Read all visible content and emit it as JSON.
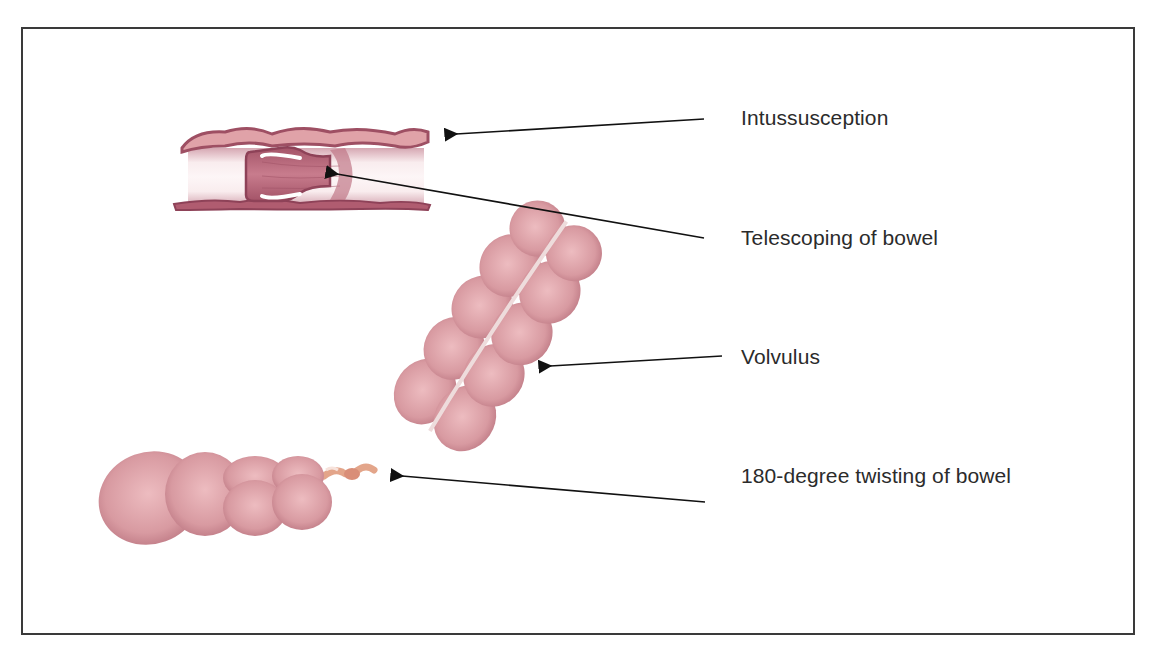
{
  "diagram": {
    "labels": [
      {
        "id": "intussusception",
        "text": "Intussusception",
        "x": 741,
        "y": 103
      },
      {
        "id": "telescoping",
        "text": "Telescoping of bowel",
        "x": 741,
        "y": 223
      },
      {
        "id": "volvulus",
        "text": "Volvulus",
        "x": 741,
        "y": 342
      },
      {
        "id": "twisting",
        "text": "180-degree twisting of bowel",
        "x": 741,
        "y": 461
      }
    ],
    "arrows": [
      {
        "from": [
          704,
          119
        ],
        "to": [
          454,
          134
        ],
        "target": "intussusception-illustration"
      },
      {
        "from": [
          704,
          238
        ],
        "to": [
          335,
          174
        ],
        "target": "telescoped-segment"
      },
      {
        "from": [
          722,
          356
        ],
        "to": [
          548,
          366
        ],
        "target": "volvulus-illustration"
      },
      {
        "from": [
          705,
          502
        ],
        "to": [
          400,
          476
        ],
        "target": "twisted-segment"
      }
    ],
    "colors": {
      "bowel_outer": "#9e4f63",
      "bowel_inner": "#c9778a",
      "bowel_pale": "#f3d9dd",
      "colon_pink": "#d99aa0",
      "colon_shadow": "#b86f7a",
      "twist": "#e3a58a",
      "border": "#3a3a3a",
      "arrow": "#111111",
      "text": "#2b2b2b"
    }
  }
}
